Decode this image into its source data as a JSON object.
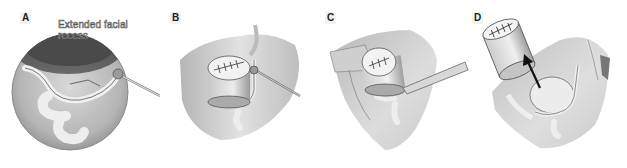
{
  "figure": {
    "panels": [
      {
        "id": "A",
        "label": "A",
        "annotation_line1": "Extended facial",
        "annotation_line2": "recess",
        "description": "Circular operative view through extended facial recess with drill/probe"
      },
      {
        "id": "B",
        "label": "B",
        "description": "Sutured cylindrical graft placed, probe instrument"
      },
      {
        "id": "C",
        "label": "C",
        "description": "Sutured cylindrical graft with flat elevator instrument"
      },
      {
        "id": "D",
        "label": "D",
        "description": "Sutured cylindrical graft lifted out with arrow indicating removal"
      }
    ],
    "colors": {
      "background": "#ffffff",
      "line_art": "#333333",
      "tissue_light": "#e6e6e6",
      "tissue_mid": "#bdbdbd",
      "tissue_dark": "#6e6e6e",
      "arrow": "#111111"
    }
  }
}
